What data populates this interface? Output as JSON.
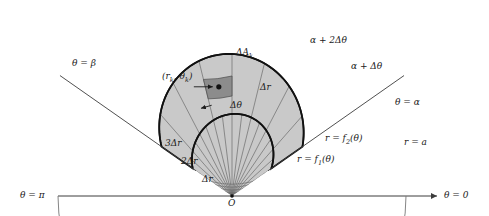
{
  "figure": {
    "colors": {
      "region_fill": "#c9c9c9",
      "cell_highlight": "#8c8c8c",
      "grid_line": "#6b6b6b",
      "axis_line": "#3c3c3c",
      "bold_curve": "#111111",
      "background": "#ffffff"
    },
    "geometry": {
      "origin_x": 232,
      "origin_y": 196,
      "outer_radius_a": 174,
      "alpha_deg": 35,
      "beta_deg": 145,
      "dr": 20,
      "n_radial_bands": 7,
      "n_angular_bands": 8
    }
  },
  "labels": {
    "theta_pi": "θ = π",
    "theta_zero": "θ = 0",
    "theta_alpha": "θ = α",
    "theta_beta": "θ = β",
    "alpha_plus_dtheta": "α + Δθ",
    "alpha_plus_2dtheta": "α + 2Δθ",
    "r_equals_a": "r = a",
    "r_f1": "r = f",
    "r_f1_sub": "1",
    "r_f1_tail": "(θ)",
    "r_f2": "r = f",
    "r_f2_sub": "2",
    "r_f2_tail": "(θ)",
    "delta_r": "Δr",
    "two_delta_r": "2Δr",
    "three_delta_r": "3Δr",
    "delta_r_cell": "Δr",
    "delta_theta_cell": "Δθ",
    "delta_area": "ΔA",
    "delta_area_sub": "k",
    "sample_point": "(r",
    "sample_point_sub1": "k",
    "sample_point_mid": ", θ",
    "sample_point_sub2": "k",
    "sample_point_tail": ")",
    "origin": "O"
  }
}
